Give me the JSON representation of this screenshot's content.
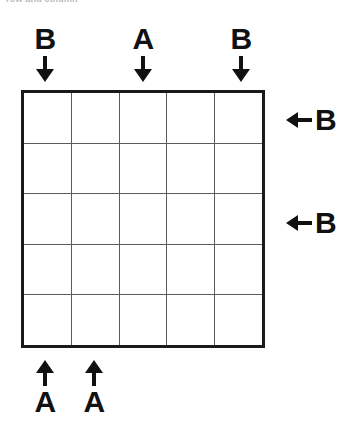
{
  "caption": {
    "text": "row and column"
  },
  "grid": {
    "rows": 5,
    "columns": 5,
    "cells": [
      [
        "",
        "",
        "",
        "",
        ""
      ],
      [
        "",
        "",
        "",
        "",
        ""
      ],
      [
        "",
        "",
        "",
        "",
        ""
      ],
      [
        "",
        "",
        "",
        "",
        ""
      ],
      [
        "",
        "",
        "",
        "",
        ""
      ]
    ],
    "border_color": "#1a1a1a",
    "line_color": "#5b5b5b",
    "fill_color": "#ffffff"
  },
  "markers": {
    "top": [
      {
        "label": "B",
        "column": 1,
        "arrow": "arrow-down-icon"
      },
      {
        "label": "A",
        "column": 3,
        "arrow": "arrow-down-icon"
      },
      {
        "label": "B",
        "column": 5,
        "arrow": "arrow-down-icon"
      }
    ],
    "bottom": [
      {
        "label": "A",
        "column": 1,
        "arrow": "arrow-up-icon"
      },
      {
        "label": "A",
        "column": 2,
        "arrow": "arrow-up-icon"
      }
    ],
    "right": [
      {
        "label": "B",
        "row": 1,
        "arrow": "arrow-left-icon"
      },
      {
        "label": "B",
        "row": 3,
        "arrow": "arrow-left-icon"
      }
    ]
  },
  "colors": {
    "ink": "#111111",
    "background": "#ffffff",
    "caption": "#b9b9b9"
  }
}
